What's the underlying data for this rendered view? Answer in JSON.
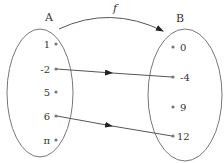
{
  "diagram": {
    "function_label": "f",
    "colors": {
      "stroke": "#777777",
      "arrow": "#222222",
      "text": "#333333",
      "dot": "#777777"
    },
    "set_a": {
      "label": "A",
      "elements": [
        "1",
        "-2",
        "5",
        "6",
        "π"
      ]
    },
    "set_b": {
      "label": "B",
      "elements": [
        "0",
        "-4",
        "9",
        "12"
      ]
    },
    "mappings": [
      {
        "from": "-2",
        "to": "-4"
      },
      {
        "from": "6",
        "to": "12"
      }
    ]
  }
}
